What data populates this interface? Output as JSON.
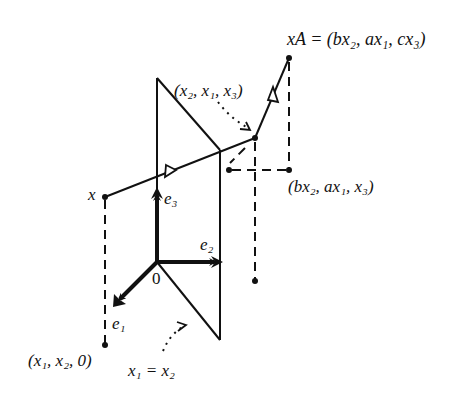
{
  "figure": {
    "labels": {
      "xA_text": "xA = (bx₂, ax₁, cx₃)",
      "x2x1x3_text": "(x₂, x₁, x₃)",
      "bx2ax1x3_text": "(bx₂, ax₁, x₃)",
      "x_text": "x",
      "e3_text": "e₃",
      "e2_text": "e₂",
      "e1_text": "e₁",
      "origin_text": "0",
      "x1x20_text": "(x₁, x₂, 0)",
      "plane_text": "x₁ = x₂"
    },
    "colors": {
      "stroke": "#111111",
      "background": "#ffffff"
    }
  }
}
